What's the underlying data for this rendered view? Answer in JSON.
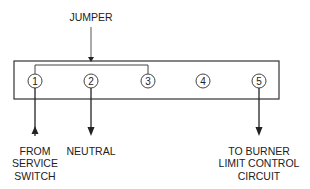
{
  "diagram": {
    "jumper_label": "JUMPER",
    "terminals": [
      {
        "id": "1",
        "x": 35
      },
      {
        "id": "2",
        "x": 91
      },
      {
        "id": "3",
        "x": 148
      },
      {
        "id": "4",
        "x": 203
      },
      {
        "id": "5",
        "x": 259
      }
    ],
    "labels": {
      "from_service_switch": [
        "FROM",
        "SERVICE",
        "SWITCH"
      ],
      "neutral": [
        "NEUTRAL"
      ],
      "to_burner": [
        "TO BURNER",
        "LIMIT CONTROL",
        "CIRCUIT"
      ]
    },
    "colors": {
      "line": "#333333",
      "background": "#ffffff"
    }
  }
}
